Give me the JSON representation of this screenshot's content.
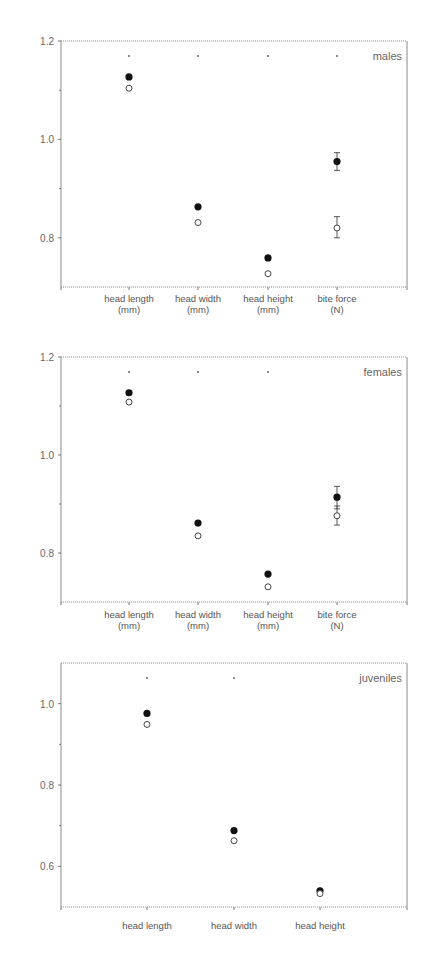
{
  "chart_data": [
    {
      "type": "scatter",
      "panel_label": "males",
      "title": "",
      "xlabel": "",
      "ylabel": "",
      "ylim": [
        0.7,
        1.2
      ],
      "yticks": [
        1.2,
        1.0,
        0.8
      ],
      "minor_yticks": [
        1.1,
        0.9
      ],
      "grid": false,
      "categories": [
        "head length (mm)",
        "head width (mm)",
        "head height (mm)",
        "bite force (N)"
      ],
      "category_lines": [
        [
          "head length",
          "(mm)"
        ],
        [
          "head width",
          "(mm)"
        ],
        [
          "head height",
          "(mm)"
        ],
        [
          "bite force",
          "(N)"
        ]
      ],
      "significance": [
        true,
        true,
        true,
        true
      ],
      "series": [
        {
          "name": "filled",
          "marker": "filled-circle",
          "values": [
            1.127,
            0.863,
            0.759,
            0.955
          ],
          "err_low": [
            null,
            null,
            null,
            0.937
          ],
          "err_high": [
            null,
            null,
            null,
            0.973
          ]
        },
        {
          "name": "open",
          "marker": "open-circle",
          "values": [
            1.104,
            0.831,
            0.727,
            0.82
          ],
          "err_low": [
            null,
            null,
            null,
            0.8
          ],
          "err_high": [
            null,
            null,
            null,
            0.843
          ]
        }
      ]
    },
    {
      "type": "scatter",
      "panel_label": "females",
      "title": "",
      "xlabel": "",
      "ylabel": "",
      "ylim": [
        0.7,
        1.2
      ],
      "yticks": [
        1.2,
        1.0,
        0.8
      ],
      "minor_yticks": [
        1.1,
        0.9
      ],
      "grid": false,
      "categories": [
        "head length (mm)",
        "head width (mm)",
        "head height (mm)",
        "bite force (N)"
      ],
      "category_lines": [
        [
          "head length",
          "(mm)"
        ],
        [
          "head width",
          "(mm)"
        ],
        [
          "head height",
          "(mm)"
        ],
        [
          "bite force",
          "(N)"
        ]
      ],
      "significance": [
        true,
        true,
        true,
        false
      ],
      "series": [
        {
          "name": "filled",
          "marker": "filled-circle",
          "values": [
            1.127,
            0.861,
            0.757,
            0.914
          ],
          "err_low": [
            null,
            null,
            null,
            0.89
          ],
          "err_high": [
            null,
            null,
            null,
            0.936
          ]
        },
        {
          "name": "open",
          "marker": "open-circle",
          "values": [
            1.108,
            0.835,
            0.731,
            0.876
          ],
          "err_low": [
            null,
            null,
            null,
            0.857
          ],
          "err_high": [
            null,
            null,
            null,
            0.896
          ]
        }
      ]
    },
    {
      "type": "scatter",
      "panel_label": "juveniles",
      "title": "",
      "xlabel": "",
      "ylabel": "",
      "ylim": [
        0.5,
        1.1
      ],
      "yticks": [
        1.0,
        0.8,
        0.6
      ],
      "minor_yticks": [
        0.9,
        0.7
      ],
      "grid": false,
      "categories": [
        "head length",
        "head width",
        "head height"
      ],
      "category_lines": [
        [
          "head length"
        ],
        [
          "head width"
        ],
        [
          "head height"
        ]
      ],
      "significance": [
        true,
        true,
        false
      ],
      "series": [
        {
          "name": "filled",
          "marker": "filled-circle",
          "values": [
            0.976,
            0.688,
            0.54
          ],
          "err_low": [
            null,
            null,
            null
          ],
          "err_high": [
            null,
            null,
            null
          ]
        },
        {
          "name": "open",
          "marker": "open-circle",
          "values": [
            0.949,
            0.663,
            0.533
          ],
          "err_low": [
            null,
            null,
            null
          ],
          "err_high": [
            null,
            null,
            null
          ]
        }
      ]
    }
  ],
  "layout": {
    "panels": [
      {
        "left": 61,
        "right": 407,
        "top": 41,
        "bottom": 287,
        "xs": [
          129,
          198,
          268,
          337
        ],
        "sig_y": 56,
        "label_y": 302
      },
      {
        "left": 61,
        "right": 407,
        "top": 357,
        "bottom": 602,
        "xs": [
          129,
          198,
          268,
          337
        ],
        "sig_y": 372,
        "label_y": 618
      },
      {
        "left": 61,
        "right": 407,
        "top": 663,
        "bottom": 907,
        "xs": [
          147,
          234,
          320
        ],
        "sig_y": 678,
        "label_y": 929
      }
    ]
  }
}
